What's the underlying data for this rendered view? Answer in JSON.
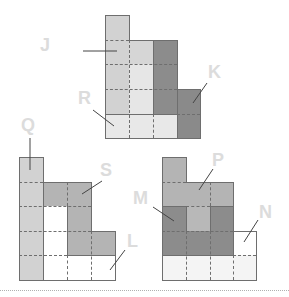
{
  "figure_count": 3,
  "labels": {
    "J": "J",
    "K": "K",
    "R": "R",
    "Q": "Q",
    "S": "S",
    "L": "L",
    "M": "M",
    "P": "P",
    "N": "N"
  },
  "colors": {
    "light_gray": "#d2d2d2",
    "lighter_gray": "#e4e4e4",
    "very_light": "#ececec",
    "medium_gray": "#b4b4b4",
    "dark_gray": "#8c8c8c",
    "white": "#ffffff",
    "line": "#6e6e6e",
    "label_text": "#dcdcdc"
  },
  "figures": [
    {
      "name": "top-figure",
      "pieces": [
        "J",
        "K",
        "R"
      ]
    },
    {
      "name": "bottom-left-figure",
      "pieces": [
        "Q",
        "S",
        "L"
      ]
    },
    {
      "name": "bottom-right-figure",
      "pieces": [
        "M",
        "P",
        "N"
      ]
    }
  ]
}
